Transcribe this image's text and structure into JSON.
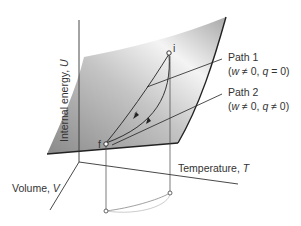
{
  "figure": {
    "type": "3d-surface-diagram",
    "axes": {
      "u_label": "Internal energy, ",
      "u_symbol": "U",
      "t_label": "Temperature, ",
      "t_symbol": "T",
      "v_label": "Volume, ",
      "v_symbol": "V"
    },
    "points": {
      "initial": "i",
      "final": "f"
    },
    "paths": [
      {
        "name": "Path 1",
        "cond_open": "(",
        "w": "w",
        "cond_mid": " ≠ 0, ",
        "q": "q",
        "cond_end": " = 0)"
      },
      {
        "name": "Path 2",
        "cond_open": "(",
        "w": "w",
        "cond_mid": " ≠ 0, ",
        "q": "q",
        "cond_end": " ≠ 0)"
      }
    ],
    "colors": {
      "surface_dark": "#8e8e8e",
      "surface_light": "#f2f2f2",
      "line": "#222222",
      "projection": "#999999"
    }
  }
}
